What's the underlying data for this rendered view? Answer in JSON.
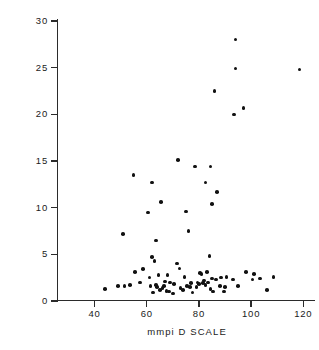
{
  "chart_data": {
    "type": "scatter",
    "title": "",
    "xlabel": "mmpi D SCALE",
    "ylabel": "POST DEX PLASMA 17OH (μg %)",
    "xlim": [
      26,
      126
    ],
    "ylim": [
      0,
      30
    ],
    "xticks": [
      40,
      60,
      80,
      100,
      120
    ],
    "xtick_labels": [
      "40",
      "60",
      "80",
      "100",
      "120"
    ],
    "yticks": [
      0,
      5,
      10,
      15,
      20,
      25,
      30
    ],
    "ytick_labels": [
      "0",
      "5",
      "10",
      "15",
      "20",
      "25",
      "30"
    ],
    "grid": false,
    "legend": null,
    "marker": "filled-circle",
    "marker_color": "#111111",
    "points": [
      [
        44.0,
        1.3
      ],
      [
        49.0,
        1.6
      ],
      [
        51.0,
        7.2
      ],
      [
        51.5,
        1.6
      ],
      [
        53.5,
        1.7
      ],
      [
        55.0,
        13.5
      ],
      [
        55.5,
        3.1
      ],
      [
        57.5,
        2.0
      ],
      [
        58.5,
        3.4
      ],
      [
        60.5,
        9.5
      ],
      [
        61.0,
        2.5
      ],
      [
        61.5,
        1.6
      ],
      [
        62.0,
        12.7
      ],
      [
        62.0,
        4.7
      ],
      [
        62.5,
        0.9
      ],
      [
        63.0,
        4.3
      ],
      [
        63.5,
        1.7
      ],
      [
        63.5,
        6.5
      ],
      [
        64.0,
        1.5
      ],
      [
        64.5,
        2.8
      ],
      [
        65.0,
        1.2
      ],
      [
        65.5,
        10.6
      ],
      [
        66.0,
        1.4
      ],
      [
        66.5,
        1.6
      ],
      [
        67.0,
        2.1
      ],
      [
        67.5,
        1.1
      ],
      [
        68.0,
        2.8
      ],
      [
        68.5,
        1.0
      ],
      [
        69.0,
        2.0
      ],
      [
        70.0,
        0.8
      ],
      [
        70.5,
        1.8
      ],
      [
        71.5,
        4.0
      ],
      [
        72.0,
        15.1
      ],
      [
        72.5,
        3.5
      ],
      [
        73.0,
        1.4
      ],
      [
        74.0,
        1.2
      ],
      [
        74.5,
        2.6
      ],
      [
        75.0,
        9.6
      ],
      [
        75.5,
        1.6
      ],
      [
        76.0,
        7.5
      ],
      [
        76.5,
        1.5
      ],
      [
        77.0,
        1.9
      ],
      [
        77.5,
        0.9
      ],
      [
        78.5,
        14.4
      ],
      [
        79.0,
        1.5
      ],
      [
        79.5,
        2.0
      ],
      [
        80.0,
        1.8
      ],
      [
        80.5,
        3.0
      ],
      [
        81.0,
        2.9
      ],
      [
        81.5,
        1.9
      ],
      [
        82.0,
        2.2
      ],
      [
        82.5,
        12.7
      ],
      [
        82.5,
        1.7
      ],
      [
        83.0,
        3.1
      ],
      [
        83.5,
        2.0
      ],
      [
        84.0,
        4.8
      ],
      [
        84.5,
        1.3
      ],
      [
        84.5,
        14.4
      ],
      [
        85.0,
        2.4
      ],
      [
        85.0,
        10.4
      ],
      [
        85.5,
        1.0
      ],
      [
        86.0,
        22.5
      ],
      [
        86.5,
        2.3
      ],
      [
        87.0,
        11.7
      ],
      [
        88.0,
        1.6
      ],
      [
        88.5,
        2.5
      ],
      [
        89.5,
        1.0
      ],
      [
        90.0,
        1.5
      ],
      [
        90.5,
        2.6
      ],
      [
        93.0,
        2.3
      ],
      [
        93.5,
        20.0
      ],
      [
        94.0,
        28.0
      ],
      [
        94.0,
        24.9
      ],
      [
        95.0,
        1.6
      ],
      [
        97.0,
        20.7
      ],
      [
        98.0,
        3.1
      ],
      [
        100.5,
        2.3
      ],
      [
        101.0,
        2.9
      ],
      [
        103.5,
        2.4
      ],
      [
        106.0,
        1.2
      ],
      [
        108.5,
        2.6
      ],
      [
        118.5,
        24.8
      ]
    ]
  }
}
